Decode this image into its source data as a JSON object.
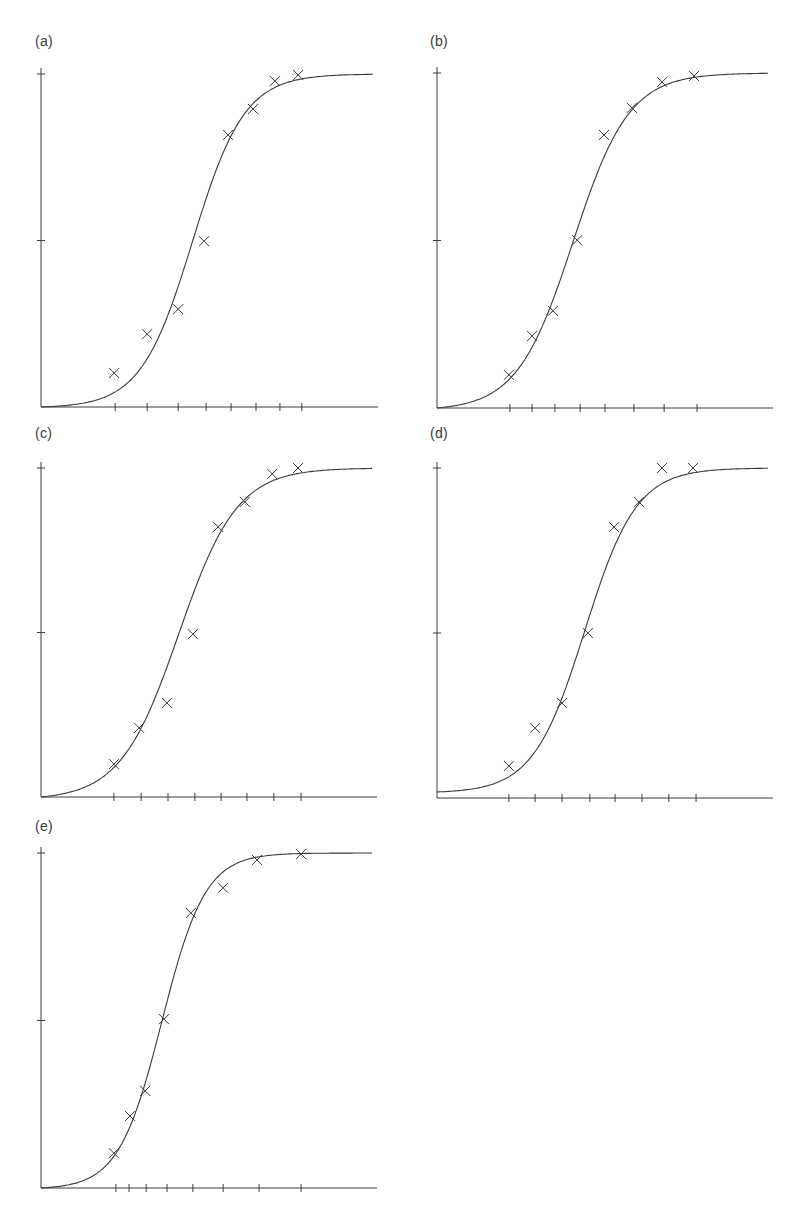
{
  "figure": {
    "panels": [
      {
        "id": "a",
        "label": "(a)"
      },
      {
        "id": "b",
        "label": "(b)"
      },
      {
        "id": "c",
        "label": "(c)"
      },
      {
        "id": "d",
        "label": "(d)"
      },
      {
        "id": "e",
        "label": "(e)"
      }
    ]
  },
  "colors": {
    "ink": "#3a3a3a",
    "background": "#ffffff"
  },
  "chart_data": [
    {
      "type": "scatter",
      "title": "(a)",
      "xlabel": "",
      "ylabel": "",
      "xlim": [
        0,
        1
      ],
      "ylim": [
        0,
        1
      ],
      "grid": false,
      "legend": null,
      "y_ticks": [
        0,
        0.5,
        1
      ],
      "x_ticks": [
        0.22,
        0.315,
        0.407,
        0.49,
        0.564,
        0.638,
        0.709,
        0.774
      ],
      "x": [
        0.217,
        0.315,
        0.407,
        0.484,
        0.555,
        0.629,
        0.694,
        0.763
      ],
      "y": [
        0.102,
        0.219,
        0.294,
        0.498,
        0.817,
        0.895,
        0.979,
        0.997
      ],
      "marker": "x",
      "fit": {
        "type": "logistic",
        "midpoint": 0.45,
        "steepness": 13.0,
        "baseline": 0.0,
        "top": 1.0
      }
    },
    {
      "type": "scatter",
      "title": "(b)",
      "xlabel": "",
      "ylabel": "",
      "xlim": [
        0,
        1
      ],
      "ylim": [
        0,
        1
      ],
      "grid": false,
      "legend": null,
      "y_ticks": [
        0,
        0.5,
        1
      ],
      "x_ticks": [
        0.217,
        0.283,
        0.351,
        0.426,
        0.5,
        0.586,
        0.676,
        0.774
      ],
      "x": [
        0.214,
        0.283,
        0.345,
        0.417,
        0.497,
        0.58,
        0.67,
        0.765
      ],
      "y": [
        0.099,
        0.215,
        0.29,
        0.501,
        0.815,
        0.896,
        0.973,
        0.991
      ],
      "marker": "x",
      "fit": {
        "type": "logistic",
        "midpoint": 0.405,
        "steepness": 12.0,
        "baseline": 0.0,
        "top": 1.0
      }
    },
    {
      "type": "scatter",
      "title": "(c)",
      "xlabel": "",
      "ylabel": "",
      "xlim": [
        0,
        1
      ],
      "ylim": [
        0,
        1
      ],
      "grid": false,
      "legend": null,
      "y_ticks": [
        0,
        0.5,
        1
      ],
      "x_ticks": [
        0.217,
        0.298,
        0.378,
        0.458,
        0.536,
        0.613,
        0.693,
        0.774
      ],
      "x": [
        0.217,
        0.292,
        0.375,
        0.452,
        0.527,
        0.607,
        0.688,
        0.765
      ],
      "y": [
        0.1,
        0.21,
        0.286,
        0.495,
        0.821,
        0.897,
        0.982,
        1.0
      ],
      "marker": "x",
      "fit": {
        "type": "logistic",
        "midpoint": 0.41,
        "steepness": 11.5,
        "baseline": 0.0,
        "top": 1.0
      }
    },
    {
      "type": "scatter",
      "title": "(d)",
      "xlabel": "",
      "ylabel": "",
      "xlim": [
        0,
        1
      ],
      "ylim": [
        0,
        1
      ],
      "grid": false,
      "legend": null,
      "y_ticks": [
        0,
        0.5,
        1
      ],
      "x_ticks": [
        0.214,
        0.292,
        0.372,
        0.455,
        0.53,
        0.61,
        0.69,
        0.771
      ],
      "x": [
        0.214,
        0.292,
        0.372,
        0.449,
        0.527,
        0.601,
        0.67,
        0.762
      ],
      "y": [
        0.097,
        0.212,
        0.288,
        0.5,
        0.821,
        0.897,
        1.0,
        1.0
      ],
      "marker": "x",
      "fit": {
        "type": "logistic",
        "midpoint": 0.44,
        "steepness": 13.0,
        "baseline": 0.015,
        "top": 1.0
      }
    },
    {
      "type": "scatter",
      "title": "(e)",
      "xlabel": "",
      "ylabel": "",
      "xlim": [
        0,
        1
      ],
      "ylim": [
        0,
        1
      ],
      "grid": false,
      "legend": null,
      "y_ticks": [
        0,
        0.5,
        1
      ],
      "x_ticks": [
        0.223,
        0.262,
        0.313,
        0.375,
        0.452,
        0.542,
        0.649,
        0.774
      ],
      "x": [
        0.217,
        0.265,
        0.31,
        0.366,
        0.446,
        0.542,
        0.643,
        0.774
      ],
      "y": [
        0.104,
        0.215,
        0.29,
        0.504,
        0.821,
        0.896,
        0.979,
        0.997
      ],
      "marker": "x",
      "fit": {
        "type": "logistic",
        "midpoint": 0.36,
        "steepness": 15.5,
        "baseline": 0.0,
        "top": 1.0
      }
    }
  ]
}
